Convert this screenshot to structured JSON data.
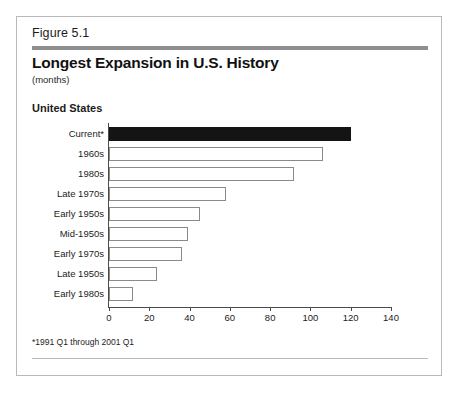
{
  "figure": {
    "number": "Figure 5.1",
    "title": "Longest Expansion in U.S. History",
    "subtitle": "(months)",
    "region_label": "United States",
    "footnote": "*1991 Q1 through 2001 Q1"
  },
  "chart_data": {
    "type": "bar",
    "orientation": "horizontal",
    "title": "Longest Expansion in U.S. History",
    "subtitle": "(months)",
    "xlabel": "",
    "ylabel": "",
    "xlim": [
      0,
      140
    ],
    "xticks": [
      0,
      20,
      40,
      60,
      80,
      100,
      120,
      140
    ],
    "xtick_labels": [
      "0",
      "20",
      "40",
      "60",
      "80",
      "100",
      "120",
      "140"
    ],
    "grid": false,
    "legend": false,
    "categories": [
      "Current*",
      "1960s",
      "1980s",
      "Late 1970s",
      "Early 1950s",
      "Mid-1950s",
      "Early 1970s",
      "Late 1950s",
      "Early 1980s"
    ],
    "values": [
      120,
      106,
      92,
      58,
      45,
      39,
      36,
      24,
      12
    ],
    "highlight_index": 0,
    "colors": {
      "highlight_bar": "#141414",
      "bar_fill": "#ffffff",
      "bar_border": "#8a8a8a",
      "axis": "#4a4a4a",
      "header_rule": "#8e8e8e",
      "frame_border": "#b9b9b9"
    }
  }
}
